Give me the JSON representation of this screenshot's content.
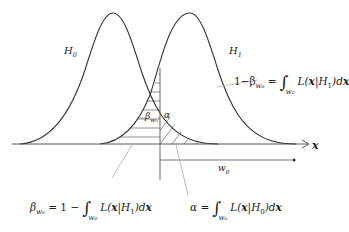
{
  "diagram": {
    "type": "hypothesis-test-distributions",
    "curves": [
      {
        "id": "H0",
        "label": "H",
        "label_sub": "0",
        "peak_x": 113,
        "peak_y": 13
      },
      {
        "id": "H1",
        "label": "H",
        "label_sub": "1",
        "peak_x": 190,
        "peak_y": 13
      }
    ],
    "axis": {
      "label": "x"
    },
    "threshold": {
      "label": "w",
      "label_sub": "0"
    },
    "regions": {
      "beta_label": "β",
      "beta_sub": "w₀",
      "alpha_label": "α"
    },
    "equations": {
      "power": {
        "lhs": "1−β",
        "lhs_sub": "w₀",
        "eq": " = ",
        "int_lower": "w₀",
        "integrand": "L(",
        "bold_x": "x",
        "given": "|H",
        "given_sub": "1",
        "close": ")d",
        "dx": "x"
      },
      "beta": {
        "lhs": "β",
        "lhs_sub": "w₀",
        "eq": " = 1 − ",
        "int_lower": "w₀",
        "integrand": "L(",
        "bold_x": "x",
        "given": "|H",
        "given_sub": "1",
        "close": ")d",
        "dx": "x"
      },
      "alpha": {
        "lhs": "α",
        "eq": " = ",
        "int_lower": "w₀",
        "integrand": "L(",
        "bold_x": "x",
        "given": "|H",
        "given_sub": "0",
        "close": ")d",
        "dx": "x"
      }
    },
    "colors": {
      "curve": "#333333",
      "hatch": "#666666",
      "leader": "#999999",
      "axis": "#444444"
    }
  }
}
